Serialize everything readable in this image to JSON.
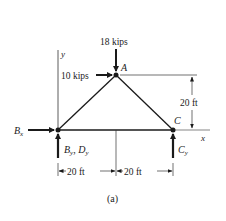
{
  "figure": {
    "caption": "(a)",
    "colors": {
      "ink": "#1a1a1a",
      "background": "#ffffff"
    }
  },
  "nodes": {
    "A": {
      "label": "A"
    },
    "B": {
      "label": ""
    },
    "C": {
      "label": "C"
    }
  },
  "loads": {
    "vertical_at_A": {
      "label": "18 kips",
      "direction": "down"
    },
    "horizontal_at_A": {
      "label": "10 kips",
      "direction": "right"
    }
  },
  "reactions": {
    "Bx": {
      "label": "B",
      "sub": "x",
      "direction": "right"
    },
    "By_Dy": {
      "label1": "B",
      "sub1": "y",
      "sep": ", ",
      "label2": "D",
      "sub2": "y",
      "direction": "up"
    },
    "Cy": {
      "label": "C",
      "sub": "y",
      "direction": "up"
    }
  },
  "axes": {
    "x_label": "x",
    "y_label": "y"
  },
  "dimensions": {
    "height": "20 ft",
    "left_span": "20 ft",
    "right_span": "20 ft"
  }
}
